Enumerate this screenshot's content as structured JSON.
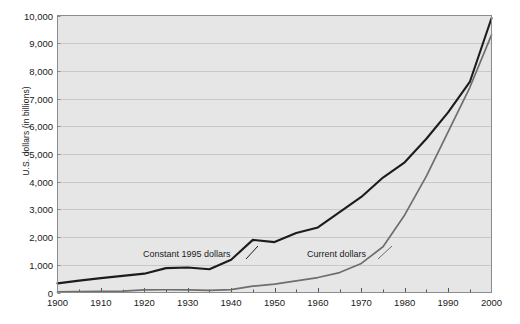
{
  "chart_data": {
    "type": "line",
    "title": "",
    "xlabel": "",
    "ylabel": "U.S. dollars (in billions)",
    "xlim": [
      1900,
      2000
    ],
    "ylim": [
      0,
      10000
    ],
    "grid": true,
    "legend_position": "inline-annotations",
    "y_ticks": [
      "0",
      "1,000",
      "2,000",
      "3,000",
      "4,000",
      "5,000",
      "6,000",
      "7,000",
      "8,000",
      "9,000",
      "10,000"
    ],
    "y_tick_values": [
      0,
      1000,
      2000,
      3000,
      4000,
      5000,
      6000,
      7000,
      8000,
      9000,
      10000
    ],
    "x_ticks": [
      "1900",
      "1910",
      "1920",
      "1930",
      "1940",
      "1950",
      "1960",
      "1970",
      "1980",
      "1990",
      "2000"
    ],
    "x_tick_values": [
      1900,
      1910,
      1920,
      1930,
      1940,
      1950,
      1960,
      1970,
      1980,
      1990,
      2000
    ],
    "x_minor_ticks": [
      1905,
      1915,
      1925,
      1935,
      1945,
      1955,
      1965,
      1975,
      1985,
      1995
    ],
    "series": [
      {
        "name": "Constant 1995 dollars",
        "color": "#1c1c1c",
        "x": [
          1900,
          1905,
          1910,
          1915,
          1920,
          1925,
          1930,
          1935,
          1940,
          1945,
          1950,
          1955,
          1960,
          1965,
          1970,
          1975,
          1980,
          1985,
          1990,
          1995,
          2000
        ],
        "values": [
          330,
          430,
          520,
          600,
          680,
          880,
          900,
          840,
          1180,
          1900,
          1820,
          2150,
          2350,
          2900,
          3450,
          4150,
          4700,
          5550,
          6500,
          7600,
          9900
        ]
      },
      {
        "name": "Current dollars",
        "color": "#6e6e6e",
        "x": [
          1900,
          1905,
          1910,
          1915,
          1920,
          1925,
          1930,
          1935,
          1940,
          1945,
          1950,
          1955,
          1960,
          1965,
          1970,
          1975,
          1980,
          1985,
          1990,
          1995,
          2000
        ],
        "values": [
          20,
          30,
          40,
          50,
          95,
          100,
          95,
          75,
          105,
          230,
          300,
          420,
          540,
          720,
          1050,
          1650,
          2800,
          4200,
          5800,
          7400,
          9300
        ]
      }
    ],
    "annotations": [
      {
        "text": "Constant 1995 dollars",
        "series": "Constant 1995 dollars"
      },
      {
        "text": "Current dollars",
        "series": "Current dollars"
      }
    ]
  },
  "colors": {
    "plot_background": "#e6e6e6",
    "page_background": "#ffffff",
    "axis": "#8c8c8c",
    "gridline": "#c9c9c9",
    "text": "#1a1a1a"
  }
}
